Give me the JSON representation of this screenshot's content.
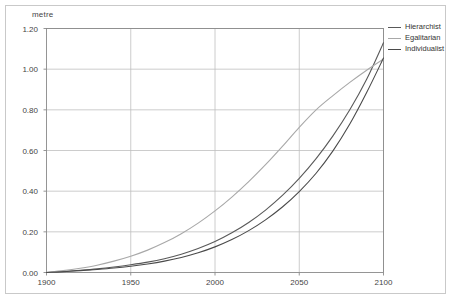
{
  "chart_data": {
    "type": "line",
    "title": "",
    "subtitle": "",
    "xlabel": "",
    "ylabel": "metre",
    "unit_label": "metre",
    "xlim": [
      1900,
      2100
    ],
    "ylim": [
      0.0,
      1.2
    ],
    "grid": true,
    "legend_position": "top-right",
    "xticks": [
      1900,
      1950,
      2000,
      2050,
      2100
    ],
    "xtick_labels": [
      "1900",
      "1950",
      "2000",
      "2050",
      "2100"
    ],
    "yticks": [
      0.0,
      0.2,
      0.4,
      0.6,
      0.8,
      1.0,
      1.2
    ],
    "ytick_labels": [
      "0.00",
      "0.20",
      "0.40",
      "0.60",
      "0.80",
      "1.00",
      "1.20"
    ],
    "x": [
      1900,
      1910,
      1920,
      1930,
      1940,
      1950,
      1960,
      1970,
      1980,
      1990,
      2000,
      2010,
      2020,
      2030,
      2040,
      2050,
      2060,
      2070,
      2080,
      2090,
      2100
    ],
    "series": [
      {
        "name": "Hierarchist",
        "color": "#595959",
        "values": [
          0.0,
          0.005,
          0.011,
          0.018,
          0.027,
          0.038,
          0.051,
          0.068,
          0.09,
          0.118,
          0.152,
          0.195,
          0.246,
          0.307,
          0.379,
          0.463,
          0.56,
          0.672,
          0.8,
          0.95,
          1.13
        ]
      },
      {
        "name": "Egalitarian",
        "color": "#a8a8a8",
        "values": [
          0.0,
          0.009,
          0.021,
          0.036,
          0.056,
          0.08,
          0.11,
          0.147,
          0.191,
          0.243,
          0.303,
          0.371,
          0.447,
          0.53,
          0.62,
          0.714,
          0.8,
          0.87,
          0.935,
          0.995,
          1.05
        ]
      },
      {
        "name": "Individualist",
        "color": "#4a4a4a",
        "values": [
          0.0,
          0.004,
          0.009,
          0.015,
          0.022,
          0.031,
          0.042,
          0.056,
          0.074,
          0.097,
          0.126,
          0.162,
          0.206,
          0.259,
          0.322,
          0.398,
          0.488,
          0.598,
          0.73,
          0.885,
          1.055
        ]
      }
    ]
  },
  "legend": {
    "entries": [
      {
        "label": "Hierarchist"
      },
      {
        "label": "Egalitarian"
      },
      {
        "label": "Individualist"
      }
    ]
  },
  "colors": {
    "frame": "#c9c9c9",
    "grid": "#bfbfbf",
    "axis": "#8a8a8a",
    "text": "#444444",
    "background": "#ffffff"
  }
}
